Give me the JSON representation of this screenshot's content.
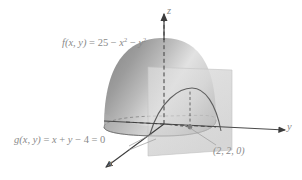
{
  "figure": {
    "type": "3d-surface-diagram",
    "background_color": "#ffffff",
    "width": 302,
    "height": 180,
    "label_color": "#8a8a8a",
    "surface": {
      "name": "paraboloid",
      "label": "f(x, y) = 25 − x² − y²",
      "label_parts": {
        "prefix": "f(x, y)",
        "equals": " = ",
        "constant": "25",
        "minus_one": " − ",
        "term_one_base": "x",
        "term_one_exp": "2",
        "minus_two": " − ",
        "term_two_base": "y",
        "term_two_exp": "2"
      },
      "fill_dark": "#8e8e8e",
      "fill_light": "#f0f0f0"
    },
    "plane": {
      "name": "constraint-plane",
      "label": "g(x, y) = x + y − 4 = 0",
      "label_parts": {
        "prefix": "g(x, y)",
        "equals_one": " = ",
        "var_x": "x",
        "plus": " + ",
        "var_y": "y",
        "minus": " − ",
        "constant": "4",
        "equals_two": " = ",
        "zero": "0"
      },
      "fill": "#dcdcdc",
      "opacity": 0.72
    },
    "marked_point": {
      "name": "point-2-2-0",
      "label": "(2, 2, 0)",
      "coordinates": [
        2,
        2,
        0
      ],
      "marker_color": "#7c7c7c"
    },
    "axes": [
      {
        "id": "x",
        "label": "x",
        "direction": "down-left",
        "arrow": true
      },
      {
        "id": "y",
        "label": "y",
        "direction": "right",
        "arrow": true
      },
      {
        "id": "z",
        "label": "z",
        "direction": "up",
        "arrow": true
      }
    ],
    "line_color": "#5a5a5a",
    "curve_color": "#6b6b6b"
  }
}
